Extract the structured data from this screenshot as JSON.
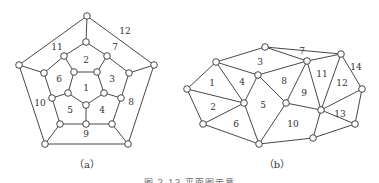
{
  "figure": {
    "caption": "图 3.13  平面图示意",
    "graphs": [
      {
        "id": "a",
        "caption": "（a）",
        "caption_pos": [
          87,
          164
        ],
        "nodes": [
          [
            87,
            16
          ],
          [
            19,
            65
          ],
          [
            154,
            65
          ],
          [
            45,
            144
          ],
          [
            128,
            144
          ],
          [
            86,
            42
          ],
          [
            64,
            56
          ],
          [
            107,
            56
          ],
          [
            44,
            73
          ],
          [
            129,
            73
          ],
          [
            52,
            98
          ],
          [
            121,
            98
          ],
          [
            74,
            72
          ],
          [
            97,
            72
          ],
          [
            104,
            93
          ],
          [
            86,
            105
          ],
          [
            68,
            93
          ],
          [
            60,
            124
          ],
          [
            86,
            124
          ],
          [
            112,
            124
          ]
        ],
        "edges": [
          [
            0,
            1
          ],
          [
            0,
            2
          ],
          [
            1,
            3
          ],
          [
            2,
            4
          ],
          [
            3,
            4
          ],
          [
            0,
            5
          ],
          [
            1,
            8
          ],
          [
            2,
            9
          ],
          [
            3,
            17
          ],
          [
            4,
            19
          ],
          [
            5,
            6
          ],
          [
            5,
            7
          ],
          [
            6,
            8
          ],
          [
            7,
            9
          ],
          [
            8,
            10
          ],
          [
            9,
            11
          ],
          [
            10,
            17
          ],
          [
            11,
            19
          ],
          [
            17,
            18
          ],
          [
            18,
            19
          ],
          [
            6,
            12
          ],
          [
            7,
            13
          ],
          [
            10,
            16
          ],
          [
            11,
            14
          ],
          [
            18,
            15
          ],
          [
            12,
            13
          ],
          [
            13,
            14
          ],
          [
            14,
            15
          ],
          [
            15,
            16
          ],
          [
            16,
            12
          ]
        ],
        "faces": [
          {
            "label": "1",
            "pos": [
              86,
              88
            ]
          },
          {
            "label": "2",
            "pos": [
              86,
              60
            ]
          },
          {
            "label": "3",
            "pos": [
              112,
              79
            ]
          },
          {
            "label": "4",
            "pos": [
              102,
              110
            ]
          },
          {
            "label": "5",
            "pos": [
              70,
              110
            ]
          },
          {
            "label": "6",
            "pos": [
              59,
              79
            ]
          },
          {
            "label": "7",
            "pos": [
              115,
              47
            ]
          },
          {
            "label": "8",
            "pos": [
              131,
              102
            ]
          },
          {
            "label": "9",
            "pos": [
              86,
              134
            ]
          },
          {
            "label": "10",
            "pos": [
              40,
              103
            ]
          },
          {
            "label": "11",
            "pos": [
              57,
              47
            ]
          },
          {
            "label": "12",
            "pos": [
              125,
              31
            ]
          }
        ]
      },
      {
        "id": "b",
        "caption": "（b）",
        "caption_pos": [
          277,
          164
        ],
        "nodes": [
          [
            187,
            89
          ],
          [
            216,
            62
          ],
          [
            265,
            47
          ],
          [
            258,
            75
          ],
          [
            244,
            103
          ],
          [
            203,
            124
          ],
          [
            259,
            144
          ],
          [
            286,
            103
          ],
          [
            307,
            61
          ],
          [
            341,
            54
          ],
          [
            362,
            89
          ],
          [
            321,
            110
          ],
          [
            355,
            124
          ],
          [
            313,
            138
          ]
        ],
        "edges": [
          [
            0,
            1
          ],
          [
            0,
            4
          ],
          [
            0,
            5
          ],
          [
            1,
            2
          ],
          [
            1,
            3
          ],
          [
            1,
            4
          ],
          [
            2,
            8
          ],
          [
            2,
            9
          ],
          [
            3,
            4
          ],
          [
            3,
            7
          ],
          [
            3,
            8
          ],
          [
            4,
            5
          ],
          [
            4,
            6
          ],
          [
            5,
            6
          ],
          [
            6,
            7
          ],
          [
            6,
            13
          ],
          [
            7,
            8
          ],
          [
            7,
            11
          ],
          [
            8,
            9
          ],
          [
            8,
            11
          ],
          [
            9,
            10
          ],
          [
            9,
            11
          ],
          [
            10,
            11
          ],
          [
            10,
            12
          ],
          [
            11,
            12
          ],
          [
            11,
            13
          ],
          [
            12,
            13
          ]
        ],
        "faces": [
          {
            "label": "1",
            "pos": [
              212,
              83
            ]
          },
          {
            "label": "2",
            "pos": [
              213,
              107
            ]
          },
          {
            "label": "3",
            "pos": [
              260,
              62
            ]
          },
          {
            "label": "4",
            "pos": [
              242,
              82
            ]
          },
          {
            "label": "5",
            "pos": [
              263,
              105
            ]
          },
          {
            "label": "6",
            "pos": [
              236,
              124
            ]
          },
          {
            "label": "7",
            "pos": [
              302,
              51
            ]
          },
          {
            "label": "8",
            "pos": [
              284,
              81
            ]
          },
          {
            "label": "9",
            "pos": [
              304,
              93
            ]
          },
          {
            "label": "10",
            "pos": [
              293,
              124
            ]
          },
          {
            "label": "11",
            "pos": [
              322,
              74
            ]
          },
          {
            "label": "12",
            "pos": [
              342,
              83
            ]
          },
          {
            "label": "13",
            "pos": [
              340,
              114
            ]
          },
          {
            "label": "14",
            "pos": [
              356,
              67
            ]
          }
        ]
      }
    ]
  }
}
